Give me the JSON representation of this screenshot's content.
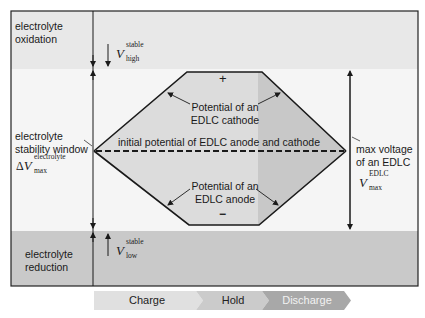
{
  "diagram": {
    "regions": {
      "oxidation": {
        "label_line1": "electrolyte",
        "label_line2": "oxidation"
      },
      "stability": {
        "label_line1": "electrolyte",
        "label_line2": "stability window"
      },
      "reduction": {
        "label_line1": "electrolyte",
        "label_line2": "reduction"
      }
    },
    "symbols": {
      "v_high": {
        "main": "V",
        "sup": "stable",
        "sub": "high"
      },
      "delta_v_max": {
        "prefix": "Δ",
        "main": "V",
        "sup": "electrolyte",
        "sub": "max"
      },
      "v_low": {
        "main": "V",
        "sup": "stable",
        "sub": "low"
      },
      "v_max_edlc": {
        "main": "V",
        "sup": "EDLC",
        "sub": "max"
      }
    },
    "hexagon": {
      "plus_sign": "+",
      "minus_sign": "−",
      "cathode_label_line1": "Potential of an",
      "cathode_label_line2": "EDLC cathode",
      "anode_label_line1": "Potential of an",
      "anode_label_line2": "EDLC anode",
      "initial_potential_label": "initial potential of EDLC anode and cathode"
    },
    "right_label": {
      "line1": "max voltage",
      "line2": "of an EDLC"
    },
    "phases": [
      {
        "label": "Charge"
      },
      {
        "label": "Hold"
      },
      {
        "label": "Discharge"
      }
    ],
    "colors": {
      "top_band": "#e6e6e6",
      "middle_band": "#f4f4f4",
      "bottom_band": "#c8c8c8",
      "hexagon_fill_left": "#dcdcdc",
      "hexagon_fill_right": "#c9c9c9",
      "line": "#1a1a1a",
      "phase_charge": "#e0e0e0",
      "phase_hold": "#cbcbcb",
      "phase_discharge": "#a8a8a8"
    }
  }
}
